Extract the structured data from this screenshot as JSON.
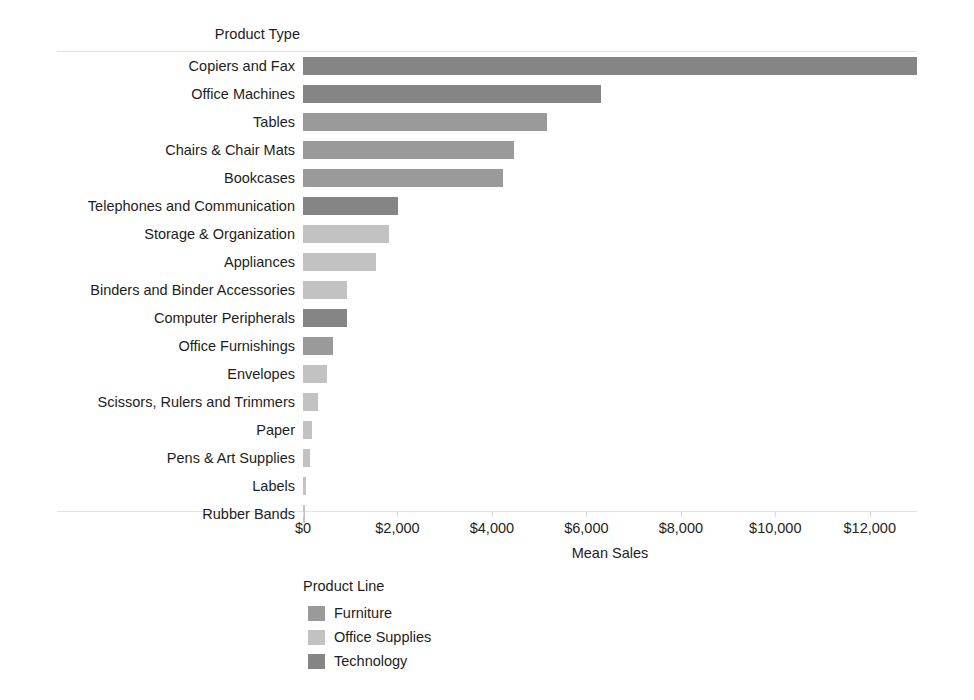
{
  "chart_data": {
    "type": "bar",
    "orientation": "horizontal",
    "title": "",
    "ylabel": "Product Type",
    "xlabel": "Mean Sales",
    "xlim": [
      0,
      13000
    ],
    "grid": false,
    "legend_position": "bottom-left",
    "xticks": [
      0,
      2000,
      4000,
      6000,
      8000,
      10000,
      12000
    ],
    "xtick_labels": [
      "$0",
      "$2,000",
      "$4,000",
      "$6,000",
      "$8,000",
      "$10,000",
      "$12,000"
    ],
    "categories": [
      "Copiers and Fax",
      "Office Machines",
      "Tables",
      "Chairs & Chair Mats",
      "Bookcases",
      "Telephones and Communication",
      "Storage & Organization",
      "Appliances",
      "Binders and Binder Accessories",
      "Computer Peripherals",
      "Office Furnishings",
      "Envelopes",
      "Scissors, Rulers and Trimmers",
      "Paper",
      "Pens & Art Supplies",
      "Labels",
      "Rubber Bands"
    ],
    "values": [
      12990,
      6320,
      5160,
      4460,
      4240,
      2020,
      1820,
      1550,
      940,
      940,
      630,
      510,
      310,
      200,
      150,
      70,
      40
    ],
    "groups": [
      "Technology",
      "Technology",
      "Furniture",
      "Furniture",
      "Furniture",
      "Technology",
      "Office Supplies",
      "Office Supplies",
      "Office Supplies",
      "Technology",
      "Furniture",
      "Office Supplies",
      "Office Supplies",
      "Office Supplies",
      "Office Supplies",
      "Office Supplies",
      "Office Supplies"
    ],
    "legend": {
      "title": "Product Line",
      "entries": [
        {
          "label": "Furniture",
          "color": "#9a9a9a"
        },
        {
          "label": "Office Supplies",
          "color": "#c2c2c2"
        },
        {
          "label": "Technology",
          "color": "#858585"
        }
      ]
    }
  }
}
